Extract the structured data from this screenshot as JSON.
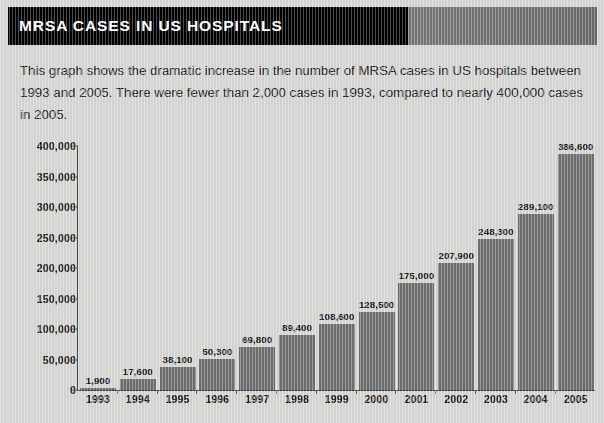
{
  "header": {
    "title": "MRSA CASES IN US HOSPITALS",
    "bar_color": "#000000",
    "accent_color": "#767676"
  },
  "description": {
    "text": "This graph shows the dramatic increase in the number of MRSA cases in US hospitals between 1993 and 2005. There were fewer than 2,000 cases in 1993, compared to nearly 400,000 cases in 2005."
  },
  "chart_data": {
    "type": "bar",
    "title": "MRSA CASES IN US HOSPITALS",
    "xlabel": "",
    "ylabel": "",
    "categories": [
      "1993",
      "1994",
      "1995",
      "1996",
      "1997",
      "1998",
      "1999",
      "2000",
      "2001",
      "2002",
      "2003",
      "2004",
      "2005"
    ],
    "values": [
      1900,
      17600,
      38100,
      50300,
      69800,
      89400,
      108600,
      128500,
      175000,
      207900,
      248300,
      289100,
      386600
    ],
    "value_labels": [
      "1,900",
      "17,600",
      "38,100",
      "50,300",
      "69,800",
      "89,400",
      "108,600",
      "128,500",
      "175,000",
      "207,900",
      "248,300",
      "289,100",
      "386,600"
    ],
    "ylim": [
      0,
      400000
    ],
    "yticks": [
      0,
      50000,
      100000,
      150000,
      200000,
      250000,
      300000,
      350000,
      400000
    ],
    "ytick_labels": [
      "0",
      "50,000",
      "100,000",
      "150,000",
      "200,000",
      "250,000",
      "300,000",
      "350,000",
      "400,000"
    ],
    "grid": false,
    "legend": null,
    "bar_color": "#6f6f6f",
    "background_color": "#d6d6d4"
  }
}
